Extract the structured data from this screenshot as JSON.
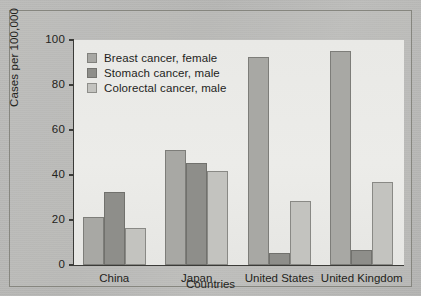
{
  "chart_data": {
    "type": "bar",
    "title": "",
    "xlabel": "Countries",
    "ylabel": "Cases per 100,000",
    "ylim": [
      0,
      100
    ],
    "yticks": [
      0,
      20,
      40,
      60,
      80,
      100
    ],
    "grid": false,
    "legend_position": "top-left",
    "categories": [
      "China",
      "Japan",
      "United States",
      "United Kingdom"
    ],
    "series": [
      {
        "name": "Breast cancer, female",
        "color": "#a8a8a4",
        "values": [
          21.5,
          51.0,
          92.5,
          95.0
        ]
      },
      {
        "name": "Stomach cancer, male",
        "color": "#8e8e8a",
        "values": [
          32.5,
          45.5,
          5.5,
          6.5
        ]
      },
      {
        "name": "Colorectal cancer, male",
        "color": "#c3c3bf",
        "values": [
          16.5,
          42.0,
          28.5,
          37.0
        ]
      }
    ]
  },
  "axes": {
    "y_tick_labels": [
      "100",
      "80",
      "60",
      "40",
      "20",
      "0"
    ],
    "y_title": "Cases per 100,000",
    "x_title": "Countries"
  },
  "legend": {
    "items": [
      {
        "label": "Breast cancer, female"
      },
      {
        "label": "Stomach cancer, male"
      },
      {
        "label": "Colorectal cancer, male"
      }
    ]
  }
}
